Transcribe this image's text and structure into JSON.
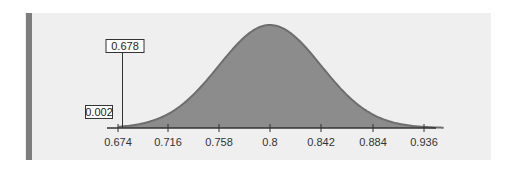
{
  "chart_data": {
    "type": "area",
    "title": "",
    "xlabel": "",
    "ylabel": "",
    "distribution": "normal",
    "mean": 0.8,
    "sd": 0.042,
    "x_ticks": [
      0.674,
      0.716,
      0.758,
      0.8,
      0.842,
      0.884,
      0.936
    ],
    "tick_labels": [
      "0.674",
      "0.716",
      "0.758",
      "0.8",
      "0.842",
      "0.884",
      "0.936"
    ],
    "xlim": [
      0.665,
      0.945
    ],
    "shaded_region": {
      "from": 0.678,
      "to": 0.945,
      "color": "#8c8c8c"
    },
    "annotations": [
      {
        "label": "0.678",
        "x": 0.678,
        "type": "cutoff-line"
      },
      {
        "label": "0.002",
        "type": "tail-area"
      }
    ],
    "grid": false,
    "legend": null
  },
  "labels": {
    "cutoff": "0.678",
    "tail_area": "0.002",
    "ticks": [
      "0.674",
      "0.716",
      "0.758",
      "0.8",
      "0.842",
      "0.884",
      "0.936"
    ]
  },
  "colors": {
    "panel": "#efefef",
    "left_bar": "#7d7d7d",
    "fill": "#8c8c8c",
    "curve": "#6e6e6e",
    "axis": "#333333"
  }
}
